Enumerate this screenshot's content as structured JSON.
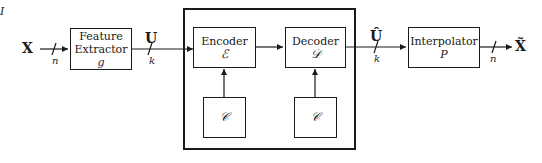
{
  "diagram": {
    "input_signal": "X",
    "input_dim": "n",
    "feature_extractor": {
      "label_line1": "Feature",
      "label_line2": "Extractor",
      "symbol": "g"
    },
    "feature_signal": "U",
    "feature_dim": "k",
    "encoder": {
      "label": "Encoder",
      "symbol": "ℰ"
    },
    "index_signal": "I",
    "decoder": {
      "label": "Decoder",
      "symbol": "𝒟"
    },
    "codebook_encoder": {
      "symbol": "𝒞"
    },
    "codebook_decoder": {
      "symbol": "𝒞"
    },
    "reconstructed_feature": "Û",
    "reconstructed_dim": "k",
    "interpolator": {
      "label": "Interpolator",
      "symbol": "P"
    },
    "output_dim": "n",
    "output_signal": "X̃"
  }
}
